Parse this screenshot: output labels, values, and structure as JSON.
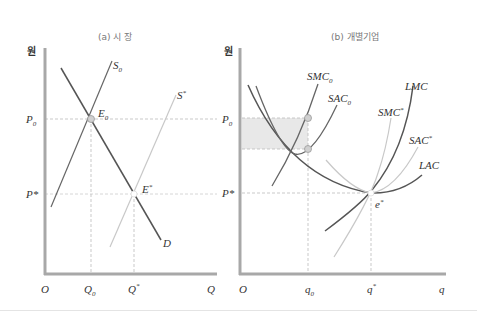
{
  "panels": [
    {
      "id": "market",
      "title": "(a) 시   장",
      "y_unit": "원",
      "y_labels": {
        "p0": "P",
        "p0_sub": "0",
        "pstar": "P*"
      },
      "x_labels": {
        "origin": "O",
        "q0": "Q",
        "q0_sub": "0",
        "qstar": "Q",
        "qstar_sup": "*",
        "axis": "Q"
      },
      "curves": {
        "s0": {
          "label": "S",
          "sub": "0"
        },
        "sstar": {
          "label": "S",
          "sup": "*"
        },
        "d": {
          "label": "D"
        }
      },
      "points": {
        "e0": {
          "label": "E",
          "sub": "0"
        },
        "estar": {
          "label": "E",
          "sup": "*"
        }
      }
    },
    {
      "id": "firm",
      "title": "(b) 개별기업",
      "y_unit": "원",
      "y_labels": {
        "p0": "P",
        "p0_sub": "0",
        "pstar": "P*"
      },
      "x_labels": {
        "origin": "O",
        "q0": "q",
        "q0_sub": "0",
        "qstar": "q",
        "qstar_sup": "*",
        "axis": "q"
      },
      "curves": {
        "smc0": {
          "label": "SMC",
          "sub": "0"
        },
        "sac0": {
          "label": "SAC",
          "sub": "0"
        },
        "lmc": {
          "label": "LMC"
        },
        "smcstar": {
          "label": "SMC",
          "sup": "*"
        },
        "sacstar": {
          "label": "SAC",
          "sup": "*"
        },
        "lac": {
          "label": "LAC"
        }
      },
      "points": {
        "estar": {
          "label": "e",
          "sup": "*"
        }
      }
    }
  ],
  "colors": {
    "axis": "#a8a8a8",
    "dark_curve": "#555555",
    "light_curve": "#c4c4c4",
    "guide": "#bbbbbb",
    "profit_area": "#e8e8e8",
    "point_fill": "#d0d0d0"
  }
}
